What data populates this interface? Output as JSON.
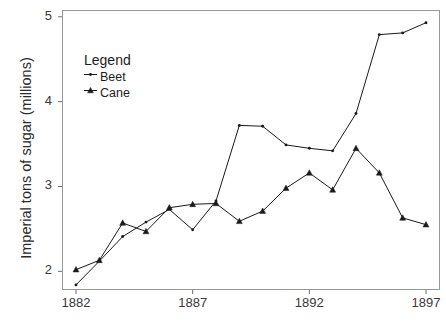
{
  "chart_data": {
    "type": "line",
    "title": "",
    "xlabel": "",
    "ylabel": "Imperial tons of sugar (millions)",
    "xlim": [
      1881.4,
      1897.6
    ],
    "ylim": [
      1.78,
      5.08
    ],
    "xticks": [
      1882,
      1887,
      1892,
      1897
    ],
    "xticklabels": [
      "1882",
      "1887",
      "1892",
      "1897"
    ],
    "yticks": [
      2,
      3,
      4,
      5
    ],
    "yticklabels": [
      "2",
      "3",
      "4",
      "5"
    ],
    "grid": false,
    "legend": {
      "title": "Legend",
      "position": "upper-left-inside",
      "entries": [
        {
          "name": "Beet",
          "marker": "dot"
        },
        {
          "name": "Cane",
          "marker": "triangle"
        }
      ]
    },
    "x": [
      1882,
      1883,
      1884,
      1885,
      1886,
      1887,
      1888,
      1889,
      1890,
      1891,
      1892,
      1893,
      1894,
      1895,
      1896,
      1897
    ],
    "series": [
      {
        "name": "Beet",
        "marker": "dot",
        "color": "#1a1a1a",
        "values": [
          1.84,
          2.12,
          2.41,
          2.58,
          2.73,
          2.49,
          2.83,
          3.72,
          3.71,
          3.49,
          3.45,
          3.42,
          3.86,
          4.79,
          4.81,
          4.93
        ]
      },
      {
        "name": "Cane",
        "marker": "triangle",
        "color": "#1a1a1a",
        "values": [
          2.02,
          2.13,
          2.57,
          2.47,
          2.75,
          2.79,
          2.8,
          2.59,
          2.71,
          2.98,
          3.16,
          2.96,
          3.45,
          3.16,
          2.63,
          2.55
        ]
      }
    ]
  },
  "axis": {
    "y_title": "Imperial tons of sugar (millions)"
  }
}
